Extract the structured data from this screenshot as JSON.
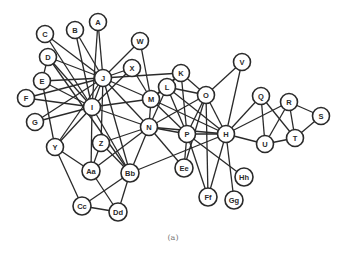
{
  "caption": "(a)",
  "colors": {
    "stroke": "#2a2a2a",
    "fill": "#ffffff",
    "caption": "#777777"
  },
  "nodes": [
    {
      "id": "A",
      "x": 98,
      "y": 22
    },
    {
      "id": "B",
      "x": 75,
      "y": 30
    },
    {
      "id": "C",
      "x": 45,
      "y": 34
    },
    {
      "id": "D",
      "x": 48,
      "y": 57
    },
    {
      "id": "E",
      "x": 42,
      "y": 81
    },
    {
      "id": "F",
      "x": 26,
      "y": 98
    },
    {
      "id": "G",
      "x": 35,
      "y": 122
    },
    {
      "id": "I",
      "x": 92,
      "y": 107
    },
    {
      "id": "J",
      "x": 103,
      "y": 78
    },
    {
      "id": "W",
      "x": 140,
      "y": 41
    },
    {
      "id": "X",
      "x": 132,
      "y": 68
    },
    {
      "id": "K",
      "x": 181,
      "y": 73
    },
    {
      "id": "L",
      "x": 167,
      "y": 87
    },
    {
      "id": "M",
      "x": 151,
      "y": 99
    },
    {
      "id": "N",
      "x": 149,
      "y": 127
    },
    {
      "id": "O",
      "x": 206,
      "y": 95
    },
    {
      "id": "V",
      "x": 242,
      "y": 62
    },
    {
      "id": "P",
      "x": 187,
      "y": 134
    },
    {
      "id": "H",
      "x": 226,
      "y": 134
    },
    {
      "id": "Q",
      "x": 261,
      "y": 96
    },
    {
      "id": "R",
      "x": 289,
      "y": 102
    },
    {
      "id": "S",
      "x": 321,
      "y": 116
    },
    {
      "id": "T",
      "x": 295,
      "y": 138
    },
    {
      "id": "U",
      "x": 265,
      "y": 144
    },
    {
      "id": "Y",
      "x": 55,
      "y": 147
    },
    {
      "id": "Z",
      "x": 101,
      "y": 143
    },
    {
      "id": "Aa",
      "x": 91,
      "y": 171
    },
    {
      "id": "Bb",
      "x": 130,
      "y": 173
    },
    {
      "id": "Cc",
      "x": 82,
      "y": 206
    },
    {
      "id": "Dd",
      "x": 118,
      "y": 212
    },
    {
      "id": "Ee",
      "x": 184,
      "y": 168
    },
    {
      "id": "Ff",
      "x": 208,
      "y": 197
    },
    {
      "id": "Gg",
      "x": 234,
      "y": 200
    },
    {
      "id": "Hh",
      "x": 244,
      "y": 177
    }
  ],
  "edges": [
    [
      "A",
      "J"
    ],
    [
      "A",
      "I"
    ],
    [
      "B",
      "J"
    ],
    [
      "B",
      "I"
    ],
    [
      "C",
      "J"
    ],
    [
      "C",
      "I"
    ],
    [
      "D",
      "J"
    ],
    [
      "D",
      "I"
    ],
    [
      "D",
      "E"
    ],
    [
      "D",
      "Bb"
    ],
    [
      "E",
      "J"
    ],
    [
      "E",
      "I"
    ],
    [
      "E",
      "Y"
    ],
    [
      "F",
      "J"
    ],
    [
      "F",
      "I"
    ],
    [
      "G",
      "J"
    ],
    [
      "G",
      "I"
    ],
    [
      "W",
      "J"
    ],
    [
      "W",
      "M"
    ],
    [
      "X",
      "J"
    ],
    [
      "X",
      "I"
    ],
    [
      "X",
      "M"
    ],
    [
      "J",
      "I"
    ],
    [
      "J",
      "M"
    ],
    [
      "J",
      "N"
    ],
    [
      "J",
      "K"
    ],
    [
      "J",
      "Y"
    ],
    [
      "J",
      "Bb"
    ],
    [
      "J",
      "Z"
    ],
    [
      "I",
      "N"
    ],
    [
      "I",
      "M"
    ],
    [
      "I",
      "Y"
    ],
    [
      "I",
      "Aa"
    ],
    [
      "I",
      "Bb"
    ],
    [
      "K",
      "L"
    ],
    [
      "K",
      "O"
    ],
    [
      "K",
      "P"
    ],
    [
      "K",
      "M"
    ],
    [
      "L",
      "M"
    ],
    [
      "L",
      "P"
    ],
    [
      "L",
      "H"
    ],
    [
      "L",
      "O"
    ],
    [
      "L",
      "N"
    ],
    [
      "M",
      "N"
    ],
    [
      "M",
      "P"
    ],
    [
      "M",
      "H"
    ],
    [
      "N",
      "P"
    ],
    [
      "N",
      "H"
    ],
    [
      "N",
      "O"
    ],
    [
      "N",
      "Ee"
    ],
    [
      "N",
      "Z"
    ],
    [
      "N",
      "Aa"
    ],
    [
      "N",
      "Bb"
    ],
    [
      "O",
      "V"
    ],
    [
      "O",
      "H"
    ],
    [
      "O",
      "P"
    ],
    [
      "O",
      "Ee"
    ],
    [
      "O",
      "Ff"
    ],
    [
      "V",
      "H"
    ],
    [
      "P",
      "H"
    ],
    [
      "P",
      "Ee"
    ],
    [
      "P",
      "Ff"
    ],
    [
      "P",
      "Hh"
    ],
    [
      "H",
      "Q"
    ],
    [
      "H",
      "R"
    ],
    [
      "H",
      "U"
    ],
    [
      "H",
      "Ff"
    ],
    [
      "H",
      "Gg"
    ],
    [
      "H",
      "Bb"
    ],
    [
      "Q",
      "U"
    ],
    [
      "Q",
      "T"
    ],
    [
      "R",
      "S"
    ],
    [
      "R",
      "T"
    ],
    [
      "R",
      "U"
    ],
    [
      "S",
      "T"
    ],
    [
      "T",
      "U"
    ],
    [
      "Y",
      "Aa"
    ],
    [
      "Y",
      "Cc"
    ],
    [
      "Z",
      "Aa"
    ],
    [
      "Z",
      "Bb"
    ],
    [
      "Aa",
      "Dd"
    ],
    [
      "Bb",
      "Cc"
    ],
    [
      "Bb",
      "Dd"
    ],
    [
      "Cc",
      "Dd"
    ]
  ]
}
